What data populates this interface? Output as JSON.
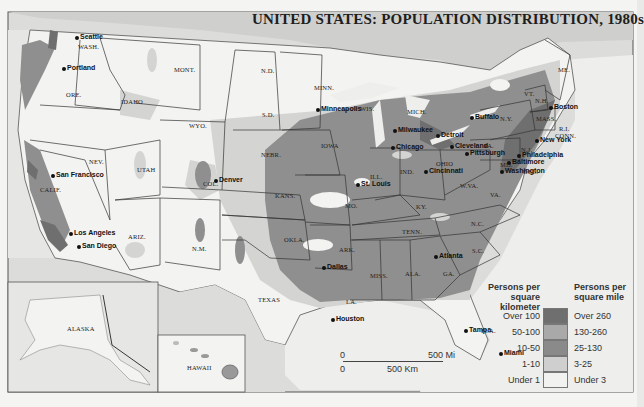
{
  "title": "UNITED STATES: POPULATION DISTRIBUTION, 1980s",
  "legend": {
    "header_metric": "Persons per square kilometer",
    "header_metric_lines": [
      "Persons per",
      "square kilometer"
    ],
    "header_imperial": "Persons per square mile",
    "header_imperial_lines": [
      "Persons per",
      "square mile"
    ],
    "classes": [
      {
        "per_km2": "Over 100",
        "per_mi2": "Over 260",
        "color": "#6f6f6f"
      },
      {
        "per_km2": "50-100",
        "per_mi2": "130-260",
        "color": "#a9a9a9"
      },
      {
        "per_km2": "10-50",
        "per_mi2": "25-130",
        "color": "#8a8a8a"
      },
      {
        "per_km2": "1-10",
        "per_mi2": "3-25",
        "color": "#cfcfcf"
      },
      {
        "per_km2": "Under 1",
        "per_mi2": "Under 3",
        "color": "#f2f2f0"
      }
    ]
  },
  "scale_bar": {
    "mi_zero": "0",
    "mi_label": "500 Mi",
    "km_zero": "0",
    "km_label": "500 Km"
  },
  "states": [
    {
      "name": "WASH.",
      "x": 78,
      "y": 43
    },
    {
      "name": "ORE.",
      "x": 66,
      "y": 91
    },
    {
      "name": "IDAHO",
      "x": 121,
      "y": 98
    },
    {
      "name": "MONT.",
      "x": 174,
      "y": 66
    },
    {
      "name": "WYO.",
      "x": 189,
      "y": 122
    },
    {
      "name": "N.D.",
      "x": 261,
      "y": 67
    },
    {
      "name": "S.D.",
      "x": 262,
      "y": 111
    },
    {
      "name": "MINN.",
      "x": 314,
      "y": 84
    },
    {
      "name": "NEV.",
      "x": 89,
      "y": 158
    },
    {
      "name": "UTAH",
      "x": 137,
      "y": 166
    },
    {
      "name": "COL.",
      "x": 203,
      "y": 180
    },
    {
      "name": "NEBR.",
      "x": 261,
      "y": 151
    },
    {
      "name": "IOWA",
      "x": 321,
      "y": 142
    },
    {
      "name": "KANS.",
      "x": 275,
      "y": 192
    },
    {
      "name": "CALIF.",
      "x": 40,
      "y": 186
    },
    {
      "name": "ARIZ.",
      "x": 128,
      "y": 233
    },
    {
      "name": "N.M.",
      "x": 192,
      "y": 245
    },
    {
      "name": "OKLA.",
      "x": 284,
      "y": 236
    },
    {
      "name": "TEXAS",
      "x": 258,
      "y": 296
    },
    {
      "name": "MO.",
      "x": 345,
      "y": 202
    },
    {
      "name": "ARK.",
      "x": 339,
      "y": 246
    },
    {
      "name": "LA.",
      "x": 346,
      "y": 298
    },
    {
      "name": "MISS.",
      "x": 370,
      "y": 272
    },
    {
      "name": "ALA.",
      "x": 405,
      "y": 270
    },
    {
      "name": "GA.",
      "x": 443,
      "y": 270
    },
    {
      "name": "TENN.",
      "x": 402,
      "y": 228
    },
    {
      "name": "KY.",
      "x": 416,
      "y": 203
    },
    {
      "name": "ILL.",
      "x": 370,
      "y": 173
    },
    {
      "name": "IND.",
      "x": 400,
      "y": 168
    },
    {
      "name": "OHIO",
      "x": 436,
      "y": 160
    },
    {
      "name": "WIS.",
      "x": 360,
      "y": 105
    },
    {
      "name": "MICH.",
      "x": 407,
      "y": 108
    },
    {
      "name": "W.VA.",
      "x": 460,
      "y": 182
    },
    {
      "name": "VA.",
      "x": 490,
      "y": 191
    },
    {
      "name": "N.C.",
      "x": 471,
      "y": 220
    },
    {
      "name": "S.C.",
      "x": 472,
      "y": 247
    },
    {
      "name": "FLA.",
      "x": 481,
      "y": 327
    },
    {
      "name": "PA.",
      "x": 484,
      "y": 142
    },
    {
      "name": "N.Y.",
      "x": 500,
      "y": 115
    },
    {
      "name": "VT.",
      "x": 524,
      "y": 90
    },
    {
      "name": "N.H.",
      "x": 535,
      "y": 97
    },
    {
      "name": "ME.",
      "x": 558,
      "y": 66
    },
    {
      "name": "MASS.",
      "x": 536,
      "y": 115
    },
    {
      "name": "R.I.",
      "x": 559,
      "y": 125
    },
    {
      "name": "CONN.",
      "x": 555,
      "y": 132
    },
    {
      "name": "N.J.",
      "x": 521,
      "y": 146
    },
    {
      "name": "MD.",
      "x": 500,
      "y": 161
    },
    {
      "name": "DEL.",
      "x": 523,
      "y": 168
    },
    {
      "name": "ALASKA",
      "x": 67,
      "y": 325
    },
    {
      "name": "HAWAII",
      "x": 187,
      "y": 364
    }
  ],
  "cities": [
    {
      "name": "Seattle",
      "x": 51,
      "y": 33,
      "dx": 24,
      "dy": 0
    },
    {
      "name": "Portland",
      "x": 35,
      "y": 63,
      "dx": 27,
      "dy": 1
    },
    {
      "name": "San Francisco",
      "x": 11,
      "y": 170,
      "dx": 40,
      "dy": 1
    },
    {
      "name": "Los Angeles",
      "x": 35,
      "y": 228,
      "dx": 34,
      "dy": 1
    },
    {
      "name": "San Diego",
      "x": 46,
      "y": 240,
      "dx": 31,
      "dy": 2
    },
    {
      "name": "Denver",
      "x": 217,
      "y": 176,
      "dx": -3,
      "dy": 0
    },
    {
      "name": "Minneapolis",
      "x": 305,
      "y": 109,
      "dx": 11,
      "dy": -4
    },
    {
      "name": "Milwaukee",
      "x": 356,
      "y": 125,
      "dx": 37,
      "dy": 1
    },
    {
      "name": "Chicago",
      "x": 367,
      "y": 146,
      "dx": 24,
      "dy": -3
    },
    {
      "name": "Detroit",
      "x": 414,
      "y": 129,
      "dx": 22,
      "dy": 2
    },
    {
      "name": "St. Louis",
      "x": 343,
      "y": 186,
      "dx": 13,
      "dy": -6
    },
    {
      "name": "Cincinnati",
      "x": 427,
      "y": 173,
      "dx": -3,
      "dy": -6
    },
    {
      "name": "Cleveland",
      "x": 453,
      "y": 145,
      "dx": -3,
      "dy": -3
    },
    {
      "name": "Pittsburgh",
      "x": 469,
      "y": 152,
      "dx": -4,
      "dy": -3
    },
    {
      "name": "Buffalo",
      "x": 474,
      "y": 116,
      "dx": -4,
      "dy": -3
    },
    {
      "name": "Boston",
      "x": 553,
      "y": 106,
      "dx": -4,
      "dy": -3
    },
    {
      "name": "New York",
      "x": 539,
      "y": 139,
      "dx": -4,
      "dy": -3
    },
    {
      "name": "Philadelphia",
      "x": 521,
      "y": 154,
      "dx": -4,
      "dy": -3
    },
    {
      "name": "Baltimore",
      "x": 511,
      "y": 161,
      "dx": -4,
      "dy": -3
    },
    {
      "name": "Washington",
      "x": 504,
      "y": 170,
      "dx": -4,
      "dy": -3
    },
    {
      "name": "Atlanta",
      "x": 437,
      "y": 256,
      "dx": -3,
      "dy": -4
    },
    {
      "name": "Dallas",
      "x": 302,
      "y": 264,
      "dx": 20,
      "dy": -1
    },
    {
      "name": "Houston",
      "x": 295,
      "y": 311,
      "dx": 36,
      "dy": 4
    },
    {
      "name": "Tampa",
      "x": 446,
      "y": 330,
      "dx": 18,
      "dy": -4
    },
    {
      "name": "Miami",
      "x": 473,
      "y": 353,
      "dx": 26,
      "dy": -4
    }
  ]
}
